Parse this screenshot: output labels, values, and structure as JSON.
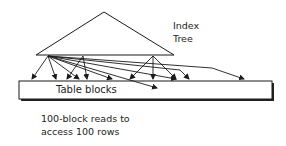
{
  "diagram": {
    "index_label": {
      "line1": "Index",
      "line2": "Tree"
    },
    "table_label": "Table blocks",
    "caption": {
      "line1": "100-block reads to",
      "line2": "access 100 rows"
    },
    "colors": {
      "stroke": "#1a1a1a",
      "shadow": "#222222",
      "background": "#ffffff"
    },
    "triangle": {
      "apex": [
        104,
        12
      ],
      "left": [
        36,
        55
      ],
      "right": [
        174,
        55
      ]
    },
    "table_box": {
      "x": 19,
      "y": 81,
      "width": 253,
      "height": 18
    },
    "arrows": [
      {
        "from": [
          48,
          56
        ],
        "to": [
          32,
          79
        ]
      },
      {
        "from": [
          48,
          56
        ],
        "to": [
          56,
          79
        ]
      },
      {
        "from": [
          48,
          56
        ],
        "to": [
          79,
          79
        ]
      },
      {
        "from": [
          48,
          56
        ],
        "to": [
          112,
          79
        ]
      },
      {
        "from": [
          48,
          56
        ],
        "to": [
          157,
          88
        ]
      },
      {
        "from": [
          48,
          56
        ],
        "to": [
          176,
          79
        ]
      },
      {
        "from": [
          48,
          56
        ],
        "to": [
          189,
          79
        ],
        "via": [
          180,
          70
        ]
      },
      {
        "from": [
          48,
          56
        ],
        "to": [
          244,
          79
        ],
        "via": [
          212,
          68
        ]
      },
      {
        "from": [
          83,
          56
        ],
        "to": [
          67,
          79
        ]
      },
      {
        "from": [
          83,
          56
        ],
        "to": [
          87,
          79
        ]
      },
      {
        "from": [
          153,
          56
        ],
        "to": [
          130,
          79
        ]
      },
      {
        "from": [
          153,
          56
        ],
        "to": [
          153,
          79
        ]
      },
      {
        "from": [
          153,
          56
        ],
        "to": [
          176,
          79
        ]
      }
    ]
  }
}
